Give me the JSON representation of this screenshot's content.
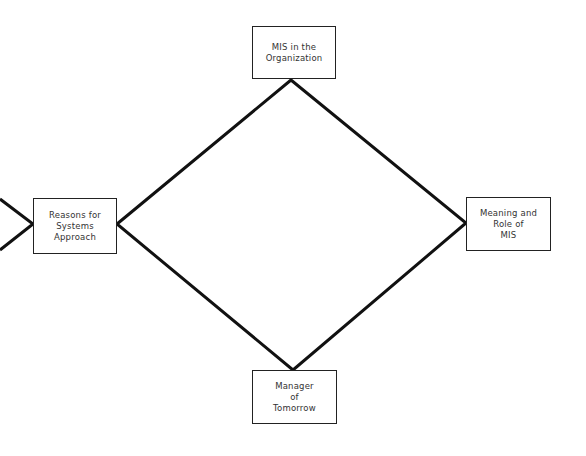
{
  "diagram": {
    "type": "diamond-flow",
    "colors": {
      "line": "#111111",
      "box_border": "#222222",
      "text": "#333333",
      "background": "#ffffff"
    },
    "nodes": [
      {
        "id": "top",
        "lines": [
          "MIS in the",
          "Organization"
        ],
        "box": {
          "x": 252,
          "y": 26,
          "w": 84,
          "h": 53
        }
      },
      {
        "id": "left",
        "lines": [
          "Reasons for",
          "Systems",
          "Approach"
        ],
        "box": {
          "x": 33,
          "y": 198,
          "w": 84,
          "h": 56
        }
      },
      {
        "id": "right",
        "lines": [
          "Meaning and",
          "Role of",
          "MIS"
        ],
        "box": {
          "x": 466,
          "y": 197,
          "w": 85,
          "h": 54
        }
      },
      {
        "id": "bottom",
        "lines": [
          "Manager",
          "of",
          "Tomorrow"
        ],
        "box": {
          "x": 252,
          "y": 370,
          "w": 85,
          "h": 54
        }
      }
    ],
    "edges": [
      {
        "from": "left",
        "to": "top"
      },
      {
        "from": "top",
        "to": "right"
      },
      {
        "from": "right",
        "to": "bottom"
      },
      {
        "from": "bottom",
        "to": "left"
      }
    ],
    "incoming_arrow": {
      "to": "left",
      "side": "left"
    }
  }
}
